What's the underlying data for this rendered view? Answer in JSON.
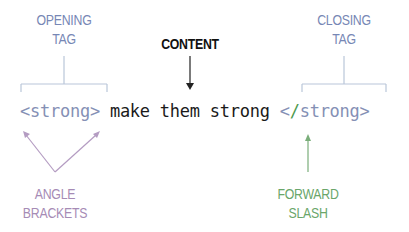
{
  "labels": {
    "opening_tag": [
      "OPENING",
      "TAG"
    ],
    "closing_tag": [
      "CLOSING",
      "TAG"
    ],
    "content": "CONTENT",
    "angle_brackets": [
      "ANGLE",
      "BRACKETS"
    ],
    "forward_slash": [
      "FORWARD",
      "SLASH"
    ]
  },
  "code": {
    "open_tag": "<strong>",
    "space1": " ",
    "content_text": "make them strong",
    "space2": " ",
    "close_lt": "<",
    "close_slash": "/",
    "close_rest": "strong>"
  },
  "colors": {
    "tag": "#8590b5",
    "label_tag": "#7787b5",
    "bracket_line": "#b9c6d9",
    "angle_brackets": "#a68bb5",
    "forward_slash": "#6aa66a",
    "content": "#111111"
  }
}
